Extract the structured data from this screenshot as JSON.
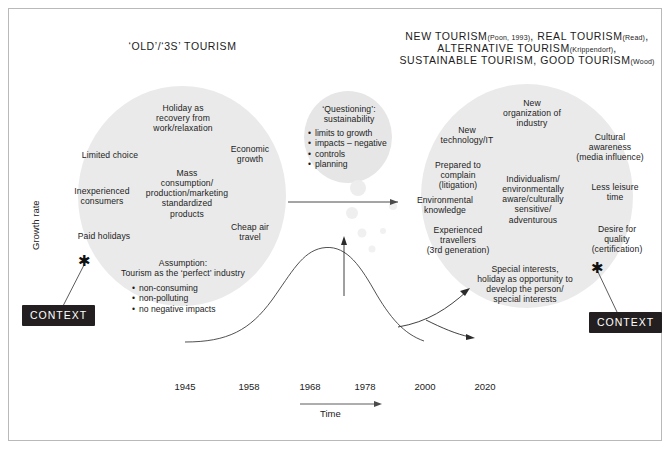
{
  "figure": {
    "y_axis_label": "Growth rate",
    "x_axis_label": "Time",
    "timeline_years": [
      "1945",
      "1958",
      "1968",
      "1978",
      "2000",
      "2020"
    ]
  },
  "left_heading": "‘OLD’/‘3S’ TOURISM",
  "right_heading": {
    "line1_a": "NEW TOURISM",
    "line1_cite_a": "(Poon, 1993)",
    "line1_b": ", REAL TOURISM",
    "line1_cite_b": "(Read)",
    "line1_c": ",",
    "line2_a": "ALTERNATIVE TOURISM",
    "line2_cite": "(Krippendorf)",
    "line2_b": ",",
    "line3_a": "SUSTAINABLE TOURISM, GOOD TOURISM",
    "line3_cite": "(Wood)"
  },
  "old_cluster": {
    "holiday_recovery": "Holiday as\nrecovery from\nwork/relaxation",
    "limited_choice": "Limited choice",
    "economic_growth": "Economic\ngrowth",
    "inexperienced": "Inexperienced\nconsumers",
    "mass_consumption": "Mass\nconsumption/\nproduction/marketing\nstandardized\nproducts",
    "cheap_air": "Cheap air\ntravel",
    "paid_holidays": "Paid holidays",
    "assumption_title": "Assumption:\nTourism as the ‘perfect’ industry",
    "assumption_bullets": [
      "non-consuming",
      "non-polluting",
      "no negative impacts"
    ]
  },
  "questioning_cluster": {
    "title": "‘Questioning’:\nsustainability",
    "bullets": [
      "limits to growth",
      "impacts – negative",
      "controls",
      "planning"
    ]
  },
  "new_cluster": {
    "new_organization": "New\norganization of\nindustry",
    "new_technology": "New\ntechnology/IT",
    "cultural_awareness": "Cultural\nawareness\n(media influence)",
    "prepared_to_complain": "Prepared to\ncomplain\n(litigation)",
    "individualism": "Individualism/\nenvironmentally\naware/culturally\nsensitive/\nadventurous",
    "less_leisure": "Less leisure\ntime",
    "environmental_knowledge": "Environmental\nknowledge",
    "experienced_travellers": "Experienced\ntravellers\n(3rd generation)",
    "desire_quality": "Desire for\nquality\n(certification)",
    "special_interests": "Special interests,\nholiday as opportunity to\ndevelop the person/\nspecial interests"
  },
  "context_left": "CONTEXT",
  "context_right": "CONTEXT",
  "asterisk_glyph": "✱",
  "colors": {
    "bubble_fill": "#eaeaea",
    "frame_border": "#b9b9b9",
    "context_bg": "#231f20",
    "context_text": "#ffffff",
    "curve_stroke": "#3d3d3d",
    "text": "#1c1c1c"
  }
}
